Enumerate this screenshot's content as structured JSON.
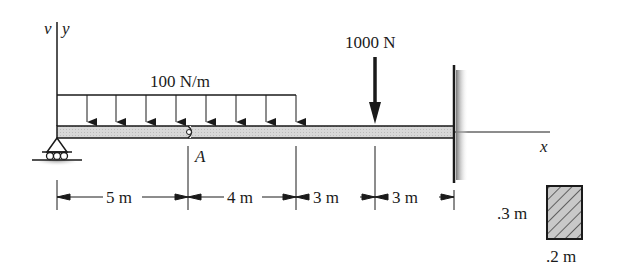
{
  "axes": {
    "v_label": "v",
    "y_label": "y",
    "x_label": "x"
  },
  "loads": {
    "distributed": {
      "label": "100 N/m",
      "magnitude": 100,
      "unit": "N/m",
      "arrow_count": 9
    },
    "point": {
      "label": "1000 N",
      "magnitude": 1000,
      "unit": "N"
    }
  },
  "points": {
    "hinge_label": "A"
  },
  "dimensions": [
    {
      "label": "5 m",
      "value": 5
    },
    {
      "label": "4 m",
      "value": 4
    },
    {
      "label": "3 m",
      "value": 3
    },
    {
      "label": "3 m",
      "value": 3
    }
  ],
  "cross_section": {
    "height_label": ".3 m",
    "width_label": ".2 m"
  },
  "supports": {
    "left": "roller-support",
    "right": "fixed-wall"
  },
  "colors": {
    "ink": "#1a1a1a",
    "beam_fill": "#d4d4d4",
    "section_fill": "#c8c8c8"
  }
}
